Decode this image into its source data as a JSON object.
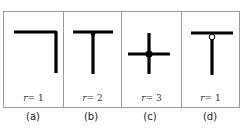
{
  "figure": {
    "panels": [
      {
        "id": "a",
        "caption": "(a)",
        "r_var": "r",
        "r_value": "= 1",
        "symbol": "corner-junction"
      },
      {
        "id": "b",
        "caption": "(b)",
        "r_var": "r",
        "r_value": "= 2",
        "symbol": "t-junction"
      },
      {
        "id": "c",
        "caption": "(c)",
        "r_var": "r",
        "r_value": "= 3",
        "symbol": "cross-junction"
      },
      {
        "id": "d",
        "caption": "(d)",
        "r_var": "r",
        "r_value": "= 1",
        "symbol": "t-junction-open-node"
      }
    ],
    "colors": {
      "stroke": "#000000",
      "border": "#9a9a9a",
      "background": "#ffffff"
    }
  }
}
